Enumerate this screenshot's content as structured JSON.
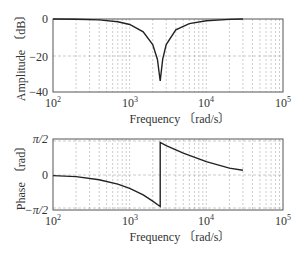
{
  "chart_data": [
    {
      "type": "line",
      "title": "",
      "xlabel": "Frequency 〔rad/s〕",
      "ylabel": "Amplitude 〔dB〕",
      "xscale": "log",
      "xlim": [
        100,
        100000
      ],
      "ylim": [
        -40,
        0
      ],
      "grid": true,
      "xticks": [
        "10^2",
        "10^3",
        "10^4",
        "10^5"
      ],
      "yticks": [
        "0",
        "−20",
        "−40"
      ],
      "series": [
        {
          "name": "amplitude",
          "x": [
            100,
            200,
            400,
            700,
            1000,
            1500,
            2000,
            2300,
            2500,
            2700,
            3000,
            4000,
            6000,
            10000,
            20000,
            30000
          ],
          "y": [
            0,
            -0.1,
            -0.5,
            -1.5,
            -3,
            -7,
            -14,
            -22,
            -34,
            -22,
            -14,
            -6,
            -2.5,
            -1,
            -0.2,
            0
          ]
        }
      ]
    },
    {
      "type": "line",
      "title": "",
      "xlabel": "Frequency 〔rad/s〕",
      "ylabel": "Phase 〔rad〕",
      "xscale": "log",
      "xlim": [
        100,
        100000
      ],
      "ylim": [
        -1.5708,
        1.5708
      ],
      "grid": true,
      "xticks": [
        "10^2",
        "10^3",
        "10^4",
        "10^5"
      ],
      "yticks": [
        "π/2",
        "0",
        "−π/2"
      ],
      "series": [
        {
          "name": "phase",
          "x": [
            100,
            200,
            400,
            700,
            1000,
            1500,
            2000,
            2500,
            2500,
            3000,
            5000,
            10000,
            20000,
            30000
          ],
          "y": [
            -0.05,
            -0.1,
            -0.25,
            -0.45,
            -0.65,
            -0.95,
            -1.25,
            -1.5,
            1.5,
            1.35,
            1.0,
            0.6,
            0.3,
            0.2
          ]
        }
      ]
    }
  ],
  "labels": {
    "amp_ylabel": "Amplitude 〔dB〕",
    "phase_ylabel": "Phase 〔rad〕",
    "xlabel": "Frequency 〔rad/s〕",
    "amp_yticks": [
      "0",
      "−20",
      "−40"
    ],
    "phase_yticks": [
      "π/2",
      "0",
      "−π/2"
    ],
    "x_base": "10",
    "x_exps": [
      "2",
      "3",
      "4",
      "5"
    ]
  }
}
